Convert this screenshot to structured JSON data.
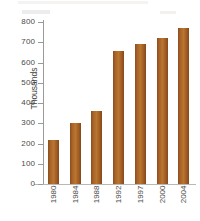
{
  "chart_data": {
    "type": "bar",
    "title": "",
    "subtitle": "",
    "xlabel": "",
    "ylabel": "Thousands",
    "categories": [
      "1980",
      "1984",
      "1988",
      "1992",
      "1997",
      "2000",
      "2004"
    ],
    "values": [
      215,
      300,
      360,
      655,
      693,
      720,
      770
    ],
    "series": [
      {
        "name": "Thousands",
        "values": [
          215,
          300,
          360,
          655,
          693,
          720,
          770
        ]
      }
    ],
    "ylim": [
      0,
      800
    ],
    "yticks": [
      0,
      100,
      200,
      300,
      400,
      500,
      600,
      700,
      800
    ],
    "ytick_labels": [
      "0",
      "100",
      "200",
      "300",
      "400",
      "500",
      "600",
      "700",
      "800"
    ],
    "grid": false,
    "legend": false,
    "legend_position": "none",
    "bar_color": "#a8642a",
    "axis_color": "#9a9a98",
    "text_color": "#4a4a48",
    "background": "#ffffff",
    "xtick_rotation": 90,
    "ylabel_rotation": 90
  }
}
